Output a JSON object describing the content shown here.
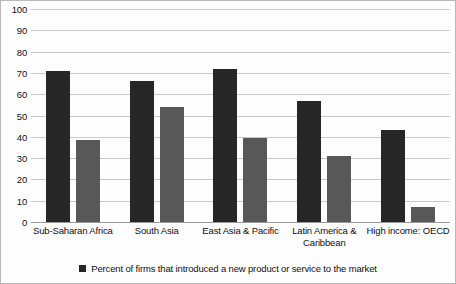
{
  "chart_data": {
    "type": "bar",
    "title": "",
    "subtitle": "",
    "xlabel": "",
    "ylabel": "",
    "ylim": [
      0,
      100
    ],
    "ytick_step": 10,
    "yticks": [
      "100",
      "90",
      "80",
      "70",
      "60",
      "50",
      "40",
      "30",
      "20",
      "10",
      "0"
    ],
    "grid": true,
    "legend_position": "bottom",
    "categories": [
      "Sub-Saharan Africa",
      "South Asia",
      "East Asia & Pacific",
      "Latin America & Caribbean",
      "High income: OECD"
    ],
    "series": [
      {
        "name": "Percent of firms that introduced a new product or service to the market",
        "color": "#262626",
        "values": [
          71,
          66,
          72,
          57,
          43
        ]
      },
      {
        "name": "",
        "color": "#585858",
        "values": [
          38.5,
          54,
          39.5,
          31,
          7
        ]
      }
    ]
  },
  "legend": {
    "items": [
      {
        "label": "Percent of firms that introduced a new product or service to the market",
        "color": "#262626"
      }
    ]
  },
  "colors": {
    "series1": "#262626",
    "series2": "#585858",
    "gridline": "#c7c7c7",
    "baseline": "#9a9a9a",
    "background": "#fdfdfd",
    "text": "#111111"
  }
}
